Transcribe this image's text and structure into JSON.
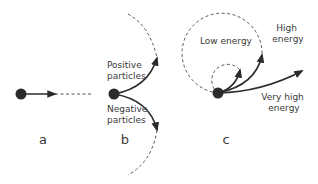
{
  "figure": {
    "colors": {
      "ink": "#2b2b2b",
      "text": "#3a3a3a",
      "background": "#ffffff"
    },
    "panels": [
      {
        "id": "a",
        "label": "a",
        "description": "Particle moving straight with no deflection"
      },
      {
        "id": "b",
        "label": "b",
        "annotations": {
          "positive": [
            "Positive",
            "particles"
          ],
          "negative": [
            "Negative",
            "particles"
          ]
        }
      },
      {
        "id": "c",
        "label": "c",
        "annotations": {
          "low": "Low energy",
          "high": [
            "High",
            "energy"
          ],
          "very_high": [
            "Very high",
            "energy"
          ]
        }
      }
    ]
  }
}
